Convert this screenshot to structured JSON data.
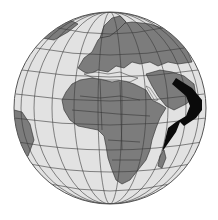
{
  "figure": {
    "colors": {
      "ocean": "#e2e2e2",
      "land": "#7c7c7c",
      "grid": "#3a3a3a",
      "border": "#2a2a2a",
      "arrow": "#0a0a0a",
      "background": "#ffffff"
    },
    "globe": {
      "cx": 110,
      "cy": 108,
      "r": 96
    },
    "arrow": {
      "direction": "curving southwest",
      "label": ""
    }
  }
}
